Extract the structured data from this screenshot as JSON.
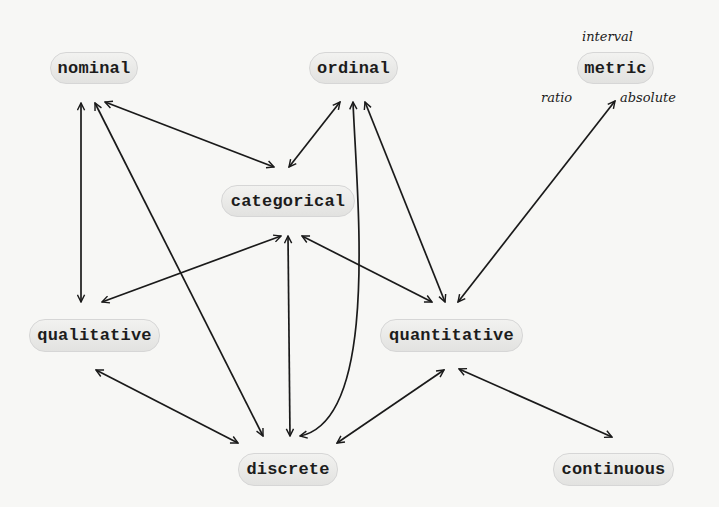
{
  "diagram": {
    "type": "graph",
    "nodes": [
      {
        "id": "nominal",
        "label": "nominal",
        "x": 50,
        "y": 52,
        "w": 88,
        "h": 32
      },
      {
        "id": "ordinal",
        "label": "ordinal",
        "x": 309,
        "y": 52,
        "w": 89,
        "h": 32
      },
      {
        "id": "metric",
        "label": "metric",
        "x": 577,
        "y": 52,
        "w": 77,
        "h": 32
      },
      {
        "id": "categorical",
        "label": "categorical",
        "x": 221,
        "y": 185,
        "w": 134,
        "h": 32
      },
      {
        "id": "qualitative",
        "label": "qualitative",
        "x": 29,
        "y": 319,
        "w": 131,
        "h": 33
      },
      {
        "id": "quantitative",
        "label": "quantitative",
        "x": 380,
        "y": 319,
        "w": 143,
        "h": 33
      },
      {
        "id": "discrete",
        "label": "discrete",
        "x": 238,
        "y": 453,
        "w": 100,
        "h": 33
      },
      {
        "id": "continuous",
        "label": "continuous",
        "x": 553,
        "y": 453,
        "w": 121,
        "h": 33
      }
    ],
    "metric_sublabels": {
      "interval": "interval",
      "ratio": "ratio",
      "absolute": "absolute"
    },
    "edges": [
      {
        "from": "nominal",
        "to": "qualitative",
        "bidirectional": true,
        "path": "M81,103 L81,302"
      },
      {
        "from": "nominal",
        "to": "discrete",
        "bidirectional": true,
        "path": "M95,103 L263,436"
      },
      {
        "from": "nominal",
        "to": "categorical",
        "bidirectional": true,
        "path": "M105,102 L274,167"
      },
      {
        "from": "ordinal",
        "to": "categorical",
        "bidirectional": true,
        "path": "M340,102 L289,167"
      },
      {
        "from": "ordinal",
        "to": "discrete",
        "bidirectional": true,
        "path": "M353,102 C357,200 380,420 300,436"
      },
      {
        "from": "ordinal",
        "to": "quantitative",
        "bidirectional": true,
        "path": "M365,102 L445,302"
      },
      {
        "from": "absolute",
        "to": "quantitative",
        "bidirectional": true,
        "path": "M615,101 L458,302"
      },
      {
        "from": "categorical",
        "to": "qualitative",
        "bidirectional": true,
        "path": "M281,236 L102,302"
      },
      {
        "from": "categorical",
        "to": "discrete",
        "bidirectional": true,
        "path": "M288,236 L290,436"
      },
      {
        "from": "categorical",
        "to": "quantitative",
        "bidirectional": true,
        "path": "M302,236 L432,302"
      },
      {
        "from": "qualitative",
        "to": "discrete",
        "bidirectional": true,
        "path": "M96,370 L238,443"
      },
      {
        "from": "quantitative",
        "to": "discrete",
        "bidirectional": true,
        "path": "M444,370 L337,443"
      },
      {
        "from": "quantitative",
        "to": "continuous",
        "bidirectional": true,
        "path": "M459,369 L612,437"
      }
    ],
    "colors": {
      "background": "#f7f7f5",
      "node_fill": "#e8e8e6",
      "node_border": "#d6d6d6",
      "edge": "#1a1a1a",
      "text": "#1c1c1c"
    }
  }
}
